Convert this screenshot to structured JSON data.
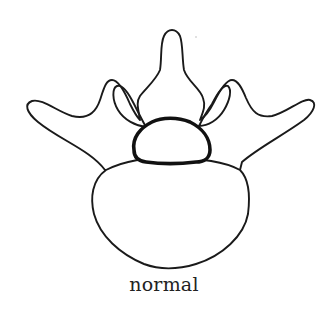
{
  "figure": {
    "caption": "normal",
    "parts": [
      {
        "name": "spinous-process"
      },
      {
        "name": "left-transverse-process"
      },
      {
        "name": "right-transverse-process"
      },
      {
        "name": "left-articular-facet"
      },
      {
        "name": "right-articular-facet"
      },
      {
        "name": "spinal-canal"
      },
      {
        "name": "vertebral-body"
      }
    ],
    "colors": {
      "line": "#1a1a1a",
      "background": "#ffffff"
    }
  }
}
